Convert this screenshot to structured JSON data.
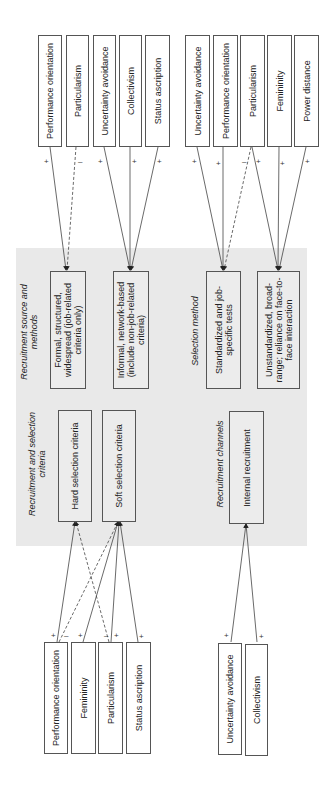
{
  "top_factors": {
    "group1": [
      "Performance orientation",
      "Particularism",
      "Uncertainty avoidance",
      "Collectivism",
      "Status ascription"
    ],
    "group2": [
      "Uncertainty avoidance",
      "Performance orientation",
      "Particularism",
      "Femininity",
      "Power distance"
    ]
  },
  "bottom_factors": {
    "group1": [
      "Performance orientation",
      "Femininity",
      "Particularism",
      "Status ascription"
    ],
    "group2": [
      "Uncertainty avoidance",
      "Collectivism"
    ]
  },
  "sections": {
    "source": {
      "title": "Recruitment source and methods",
      "boxes": [
        "Formal, structured, widespread (job-related criteria only)",
        "Informal, network-based (include non-job-related criteria)"
      ]
    },
    "selection": {
      "title": "Selection method",
      "boxes": [
        "Standardized and job-specific tests",
        "Unstandardized, broad-range; reliance on face-to-face interaction"
      ]
    },
    "criteria": {
      "title": "Recruitment and selection criteria",
      "boxes": [
        "Hard selection criteria",
        "Soft selection criteria"
      ]
    },
    "channels": {
      "title": "Recruitment channels",
      "boxes": [
        "Internal recruitment"
      ]
    }
  },
  "signs": {
    "positive": "+",
    "negative": "–"
  },
  "colors": {
    "line": "#444444",
    "shade": "#e9e9e9",
    "border": "#555555"
  }
}
